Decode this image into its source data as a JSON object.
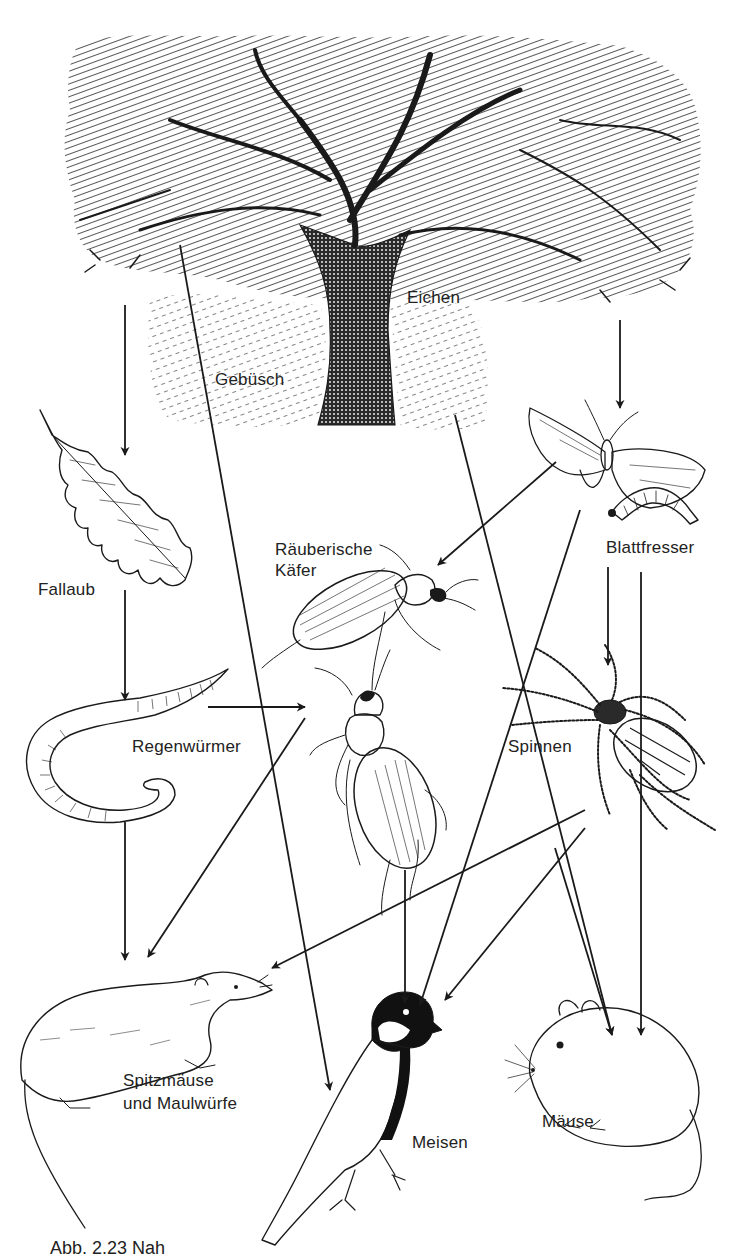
{
  "figure": {
    "caption_visible": "Abb. 2.23 Nah",
    "ink_color": "#1a1a1a",
    "background": "#ffffff"
  },
  "nodes": {
    "eichen": {
      "label": "Eichen",
      "x": 407,
      "y": 290
    },
    "gebuesch": {
      "label": "Gebüsch",
      "x": 215,
      "y": 370
    },
    "fallaub": {
      "label": "Fallaub",
      "x": 38,
      "y": 580
    },
    "raeuberische_kaefer": {
      "line1": "Räuberische",
      "line2": "Käfer",
      "x": 275,
      "y": 540
    },
    "blattfresser": {
      "label": "Blattfresser",
      "x": 606,
      "y": 537
    },
    "regenwuermer": {
      "label": "Regenwürmer",
      "x": 132,
      "y": 736
    },
    "spinnen": {
      "label": "Spinnen",
      "x": 508,
      "y": 737
    },
    "spitzmaeuse": {
      "line1": "Spitzmäuse",
      "line2": "und Maulwürfe",
      "x": 123,
      "y": 1072
    },
    "meisen": {
      "label": "Meisen",
      "x": 412,
      "y": 1135
    },
    "maeuse": {
      "label": "Mäuse",
      "x": 542,
      "y": 1113
    }
  },
  "edges": [
    {
      "from": "eichen",
      "to": "fallaub",
      "x1": 125,
      "y1": 305,
      "x2": 125,
      "y2": 455
    },
    {
      "from": "fallaub",
      "to": "regenwuermer",
      "x1": 125,
      "y1": 590,
      "x2": 125,
      "y2": 700
    },
    {
      "from": "regenwuermer",
      "to": "raeuberische_kaefer",
      "x1": 208,
      "y1": 707,
      "x2": 305,
      "y2": 707
    },
    {
      "from": "regenwuermer",
      "to": "spitzmaeuse",
      "x1": 125,
      "y1": 822,
      "x2": 125,
      "y2": 960
    },
    {
      "from": "gebuesch",
      "to": "meisen",
      "x1": 180,
      "y1": 245,
      "x2": 330,
      "y2": 1090
    },
    {
      "from": "eichen",
      "to": "maeuse",
      "x1": 455,
      "y1": 415,
      "x2": 612,
      "y2": 1035
    },
    {
      "from": "eichen",
      "to": "blattfresser",
      "x1": 620,
      "y1": 320,
      "x2": 620,
      "y2": 408
    },
    {
      "from": "blattfresser",
      "to": "raeuberische_kaefer",
      "x1": 556,
      "y1": 462,
      "x2": 438,
      "y2": 565
    },
    {
      "from": "blattfresser",
      "to": "meisen",
      "x1": 580,
      "y1": 510,
      "x2": 420,
      "y2": 1005
    },
    {
      "from": "blattfresser",
      "to": "spinnen",
      "x1": 608,
      "y1": 567,
      "x2": 608,
      "y2": 665
    },
    {
      "from": "blattfresser",
      "to": "maeuse",
      "x1": 641,
      "y1": 572,
      "x2": 641,
      "y2": 1035
    },
    {
      "from": "raeuberische_kaefer",
      "to": "spitzmaeuse",
      "x1": 305,
      "y1": 718,
      "x2": 148,
      "y2": 957
    },
    {
      "from": "raeuberische_kaefer",
      "to": "meisen",
      "x1": 405,
      "y1": 870,
      "x2": 405,
      "y2": 1003
    },
    {
      "from": "spinnen",
      "to": "spitzmaeuse",
      "x1": 585,
      "y1": 810,
      "x2": 272,
      "y2": 968
    },
    {
      "from": "spinnen",
      "to": "meisen",
      "x1": 585,
      "y1": 828,
      "x2": 445,
      "y2": 1000
    },
    {
      "from": "spinnen",
      "to": "maeuse",
      "x1": 555,
      "y1": 848,
      "x2": 612,
      "y2": 1035
    }
  ],
  "illustrations": [
    {
      "name": "oak-tree",
      "depicts": "Eichen / Gebüsch"
    },
    {
      "name": "oak-leaf",
      "depicts": "Fallaub"
    },
    {
      "name": "moth",
      "depicts": "Blattfresser (Falter)"
    },
    {
      "name": "caterpillar",
      "depicts": "Blattfresser (Raupe)"
    },
    {
      "name": "ground-beetle-large",
      "depicts": "Räuberische Käfer"
    },
    {
      "name": "ground-beetle-small",
      "depicts": "Räuberische Käfer"
    },
    {
      "name": "earthworm",
      "depicts": "Regenwürmer"
    },
    {
      "name": "spider",
      "depicts": "Spinnen"
    },
    {
      "name": "shrew",
      "depicts": "Spitzmäuse und Maulwürfe"
    },
    {
      "name": "great-tit",
      "depicts": "Meisen"
    },
    {
      "name": "mouse",
      "depicts": "Mäuse"
    }
  ]
}
